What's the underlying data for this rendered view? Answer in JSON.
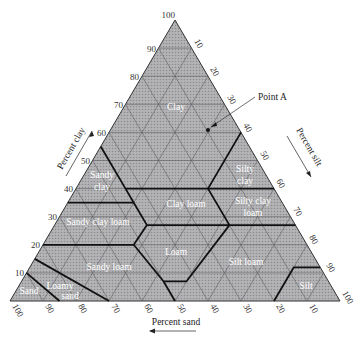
{
  "diagram": {
    "type": "soil-texture-triangle",
    "axes": {
      "clay": {
        "title": "Percent clay",
        "ticks": [
          "10",
          "20",
          "30",
          "40",
          "50",
          "60",
          "70",
          "80",
          "90",
          "100"
        ]
      },
      "silt": {
        "title": "Percent silt",
        "ticks": [
          "10",
          "20",
          "30",
          "40",
          "50",
          "60",
          "70",
          "80",
          "90",
          "100"
        ]
      },
      "sand": {
        "title": "Percent sand",
        "ticks": [
          "100",
          "90",
          "80",
          "70",
          "60",
          "50",
          "40",
          "30",
          "20",
          "10"
        ]
      }
    },
    "regions": [
      {
        "name": "Clay",
        "lines": [
          "Clay"
        ]
      },
      {
        "name": "Sandy clay",
        "lines": [
          "Sandy",
          "clay"
        ]
      },
      {
        "name": "Silty clay",
        "lines": [
          "Silty",
          "clay"
        ]
      },
      {
        "name": "Sandy clay loam",
        "lines": [
          "Sandy clay loam"
        ]
      },
      {
        "name": "Clay loam",
        "lines": [
          "Clay loam"
        ]
      },
      {
        "name": "Silty clay loam",
        "lines": [
          "Silty clay",
          "loam"
        ]
      },
      {
        "name": "Loam",
        "lines": [
          "Loam"
        ]
      },
      {
        "name": "Sandy loam",
        "lines": [
          "Sandy loam"
        ]
      },
      {
        "name": "Silt loam",
        "lines": [
          "Silt loam"
        ]
      },
      {
        "name": "Loamy sand",
        "lines": [
          "Loamy",
          "sand"
        ]
      },
      {
        "name": "Sand",
        "lines": [
          "Sand"
        ]
      },
      {
        "name": "Silt",
        "lines": [
          "Silt"
        ]
      }
    ],
    "annotation": {
      "label": "Point A"
    },
    "colors": {
      "fill": "#a9a9ab",
      "grid": "#6b6b6e",
      "boundary": "#1a1a1a",
      "text": "#ffffff"
    }
  }
}
